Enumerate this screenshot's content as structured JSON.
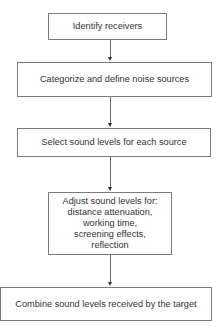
{
  "diagram": {
    "type": "flowchart",
    "direction": "top-to-bottom",
    "steps": [
      {
        "id": "b1",
        "label": "Identify receivers"
      },
      {
        "id": "b2",
        "label": "Categorize and define noise sources"
      },
      {
        "id": "b3",
        "label": "Select sound levels for each source"
      },
      {
        "id": "b4",
        "label": "Adjust sound levels for:",
        "lines": [
          "Adjust sound levels for:",
          "distance attenuation,",
          "working time,",
          "screening effects,",
          "reflection"
        ]
      },
      {
        "id": "b5",
        "label": "Combine sound levels received by the target"
      }
    ],
    "edges": [
      {
        "from": "b1",
        "to": "b2"
      },
      {
        "from": "b2",
        "to": "b3"
      },
      {
        "from": "b3",
        "to": "b4"
      },
      {
        "from": "b4",
        "to": "b5"
      }
    ],
    "colors": {
      "border": "#7a7a7a",
      "text": "#333333",
      "arrow": "#333333",
      "background": "#ffffff"
    }
  }
}
